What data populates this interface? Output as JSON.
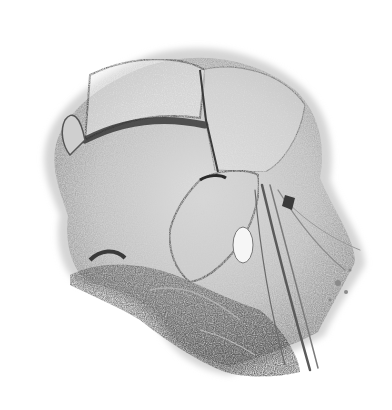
{
  "image": {
    "subject": "Stippled grayscale anatomical illustration of an organ with folded tissue and vessels",
    "style": "pencil/stipple engraving, grayscale",
    "background_color": "#ffffff",
    "palette": {
      "dark": "#3a3a3a",
      "mid": "#7a7a7a",
      "light": "#bdbdbd",
      "highlight": "#f2f2f2"
    }
  }
}
